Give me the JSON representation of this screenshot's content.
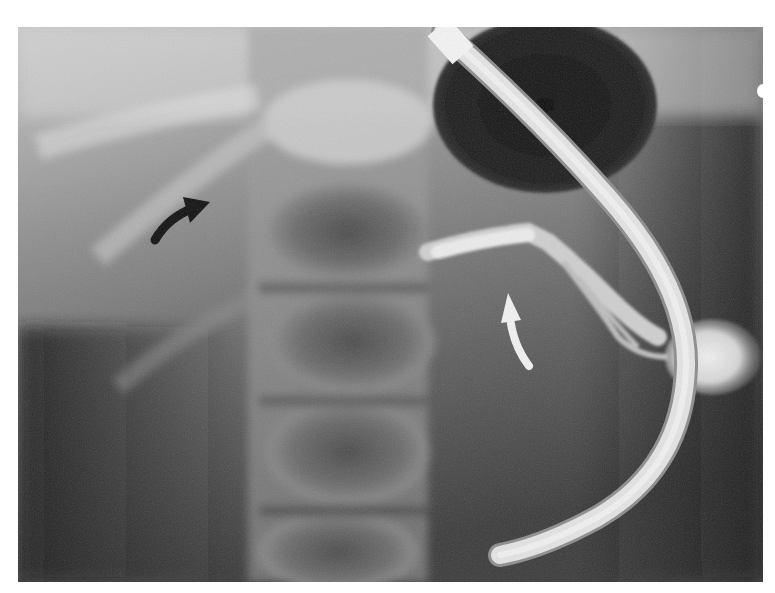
{
  "image": {
    "kind": "radiograph",
    "description": "Abdominal fluoroscopic image with a curved catheter and contrast-filled duct",
    "colors": {
      "background": "#ffffff",
      "bone_light": "#d9d9d9",
      "soft_tissue": "#6d6d6d",
      "gas_dark": "#161616",
      "catheter": "#e6e6e6",
      "contrast": "#ececec",
      "arrow_black": "#0f0f0f",
      "arrow_white": "#f2f2f2"
    }
  },
  "annotations": [
    {
      "id": "black-arrow",
      "type": "curved-arrow",
      "color": "black",
      "direction": "up-right"
    },
    {
      "id": "white-arrow",
      "type": "curved-arrow",
      "color": "white",
      "direction": "up"
    }
  ],
  "structures": [
    {
      "id": "catheter",
      "label": "catheter"
    },
    {
      "id": "gas-filled-viscus",
      "label": "gas-filled viscus"
    },
    {
      "id": "contrast-duct",
      "label": "contrast-filled duct"
    },
    {
      "id": "contrast-collection",
      "label": "contrast collection"
    },
    {
      "id": "vertebral-column",
      "label": "vertebral column"
    }
  ]
}
